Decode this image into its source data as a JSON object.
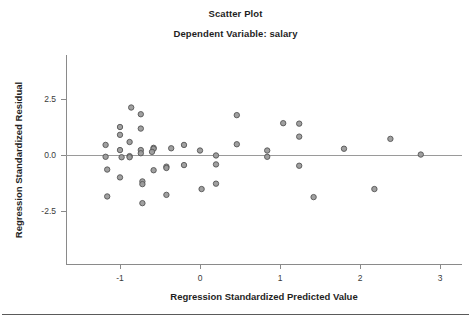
{
  "chart_data": {
    "type": "scatter",
    "title": "Scatter Plot",
    "subtitle": "Dependent Variable: salary",
    "xlabel": "Regression Standardized Predicted Value",
    "ylabel": "Regression Standardized Residual",
    "xticks": [
      "-1",
      "0",
      "1",
      "2",
      "3"
    ],
    "xtick_values": [
      -1,
      0,
      1,
      2,
      3
    ],
    "yticks": [
      "2.5",
      "0.0",
      "-2.5"
    ],
    "ytick_values": [
      2.5,
      0.0,
      -2.5
    ],
    "xlim": [
      -1.65,
      3.25
    ],
    "ylim": [
      -4.5,
      4.5
    ],
    "grid": false,
    "legend": false,
    "reference_line_y": 0.0,
    "marker": {
      "shape": "circle",
      "fill_color": "#9b9b9b",
      "edge_color": "#555555",
      "size_px": 5.4
    },
    "n_points": 48,
    "points": [
      {
        "x": -1.18,
        "y": 0.45
      },
      {
        "x": -1.18,
        "y": -0.08
      },
      {
        "x": -1.16,
        "y": -0.65
      },
      {
        "x": -1.16,
        "y": -1.85
      },
      {
        "x": -1.0,
        "y": 1.25
      },
      {
        "x": -1.0,
        "y": 0.9
      },
      {
        "x": -1.0,
        "y": 0.22
      },
      {
        "x": -0.98,
        "y": -0.1
      },
      {
        "x": -1.0,
        "y": -1.0
      },
      {
        "x": -0.88,
        "y": 0.58
      },
      {
        "x": -0.88,
        "y": -0.05
      },
      {
        "x": -0.88,
        "y": -0.1
      },
      {
        "x": -0.86,
        "y": 2.12
      },
      {
        "x": -0.74,
        "y": 1.82
      },
      {
        "x": -0.74,
        "y": 1.18
      },
      {
        "x": -0.74,
        "y": 0.22
      },
      {
        "x": -0.74,
        "y": 0.08
      },
      {
        "x": -0.72,
        "y": -1.18
      },
      {
        "x": -0.72,
        "y": -1.3
      },
      {
        "x": -0.72,
        "y": -2.15
      },
      {
        "x": -0.58,
        "y": 0.32
      },
      {
        "x": -0.58,
        "y": 0.28
      },
      {
        "x": -0.58,
        "y": -0.68
      },
      {
        "x": -0.42,
        "y": -0.52
      },
      {
        "x": -0.42,
        "y": -0.58
      },
      {
        "x": -0.42,
        "y": -1.78
      },
      {
        "x": -0.2,
        "y": 0.45
      },
      {
        "x": -0.2,
        "y": -0.45
      },
      {
        "x": 0.0,
        "y": 0.2
      },
      {
        "x": 0.02,
        "y": -1.52
      },
      {
        "x": 0.2,
        "y": -0.02
      },
      {
        "x": 0.2,
        "y": -0.42
      },
      {
        "x": 0.2,
        "y": -1.28
      },
      {
        "x": 0.46,
        "y": 1.78
      },
      {
        "x": 0.46,
        "y": 0.48
      },
      {
        "x": 0.84,
        "y": 0.2
      },
      {
        "x": 0.84,
        "y": -0.08
      },
      {
        "x": 1.04,
        "y": 1.42
      },
      {
        "x": 1.24,
        "y": 1.4
      },
      {
        "x": 1.24,
        "y": 0.82
      },
      {
        "x": 1.24,
        "y": -0.48
      },
      {
        "x": 1.42,
        "y": -1.88
      },
      {
        "x": 1.8,
        "y": 0.28
      },
      {
        "x": 2.18,
        "y": -1.52
      },
      {
        "x": 2.38,
        "y": 0.72
      },
      {
        "x": 2.76,
        "y": 0.02
      },
      {
        "x": -0.6,
        "y": 0.14
      },
      {
        "x": -0.36,
        "y": 0.3
      }
    ]
  },
  "figure": {
    "background_color": "#ffffff",
    "axis_color": "#8a8a8a",
    "text_color": "#1f1f1f"
  }
}
